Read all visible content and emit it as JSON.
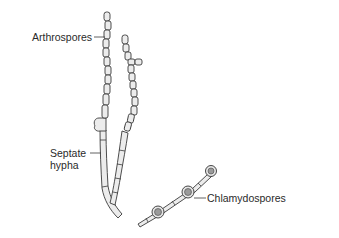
{
  "figure": {
    "labels": {
      "arthrospores": "Arthrospores",
      "septate_line1": "Septate",
      "septate_line2": "hypha",
      "chlamydospores": "Chlamydospores"
    },
    "colors": {
      "line": "#3a3a3a",
      "fill": "#ececec",
      "spore_core": "#9a9a9a",
      "text": "#2a2a2a"
    }
  }
}
